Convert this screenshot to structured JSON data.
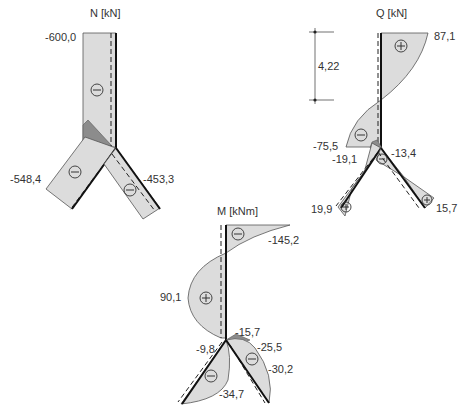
{
  "diagrams": {
    "normal_force": {
      "title": "N [kN]",
      "labels": {
        "top": "-600,0",
        "left_leg": "-548,4",
        "right_leg": "-453,3"
      },
      "signs": [
        "minus",
        "minus",
        "minus"
      ]
    },
    "shear_force": {
      "title": "Q [kN]",
      "dimension": "4,22",
      "labels": {
        "top": "87,1",
        "node_left": "-75,5",
        "left_leg_top": "-19,1",
        "right_leg_top": "-13,4",
        "left_leg_end": "19,9",
        "right_leg_end": "15,7"
      },
      "signs": [
        "plus",
        "minus",
        "minus",
        "plus",
        "plus"
      ]
    },
    "bending_moment": {
      "title": "M [kNm]",
      "labels": {
        "top": "-145,2",
        "span": "90,1",
        "node": "-15,7",
        "left_leg_top": "-9,8",
        "right_leg_top": "-25,5",
        "right_leg": "-30,2",
        "left_leg": "-34,7"
      },
      "signs": [
        "minus",
        "plus",
        "minus",
        "minus"
      ]
    }
  },
  "colors": {
    "fill": "#dcdcdc",
    "dark_fill": "#8c8c8c",
    "member": "#111111",
    "text": "#333333"
  }
}
